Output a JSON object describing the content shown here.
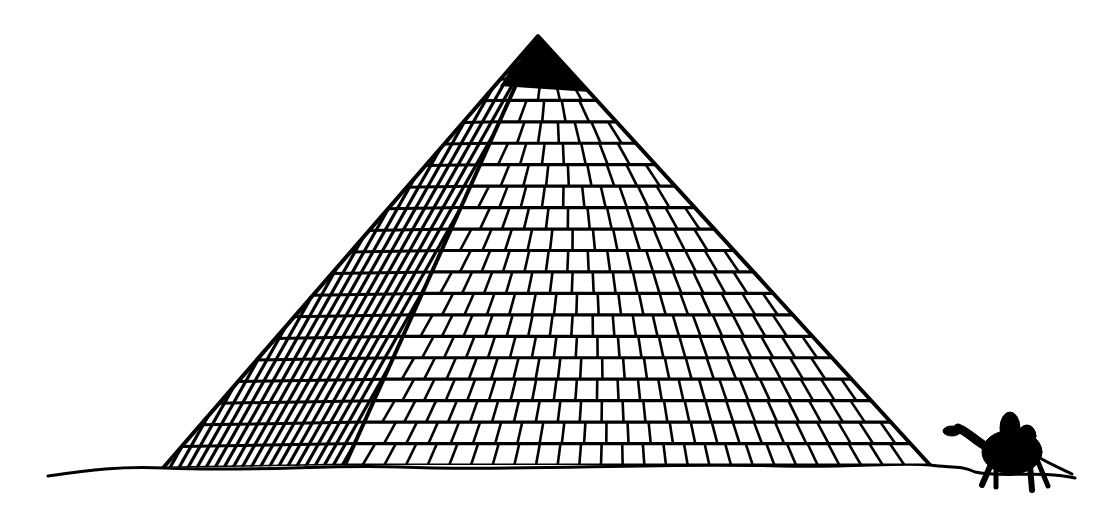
{
  "image": {
    "description": "Black ink line drawing of a stepped pyramid with a camel silhouette at its right base",
    "ink_color": "#000000",
    "background_color": "#ffffff"
  },
  "pyramid": {
    "apex": [
      538,
      36
    ],
    "left_base": [
      163,
      468
    ],
    "ridge_base": [
      345,
      465
    ],
    "right_base": [
      930,
      465
    ],
    "shaded_face": "left",
    "courses": 20
  },
  "camel": {
    "position": [
      1000,
      450
    ]
  },
  "ground": {
    "y": 470
  }
}
